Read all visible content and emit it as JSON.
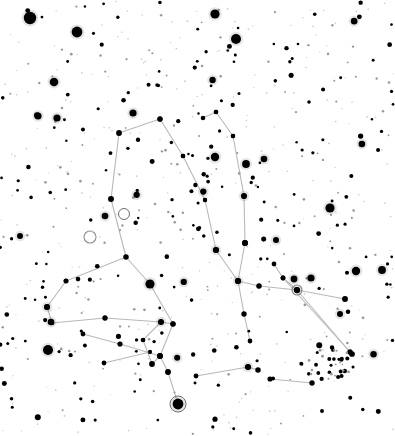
{
  "chart_data": {
    "type": "scatter",
    "title": "",
    "subtitle": "",
    "xlabel": "",
    "ylabel": "",
    "grid": false,
    "legend": "none",
    "xlim": [
      0,
      395
    ],
    "ylim": [
      0,
      436
    ],
    "background_color": "#ffffff",
    "star_color": "#000000",
    "faint_star_color": "#9a9a9a",
    "line_color": "#b8b8b8",
    "marker_color": "#8f8f8f",
    "magnitude_scale_note": "dot radius in px encodes brightness; larger = brighter",
    "counts": {
      "stars_plotted": 612,
      "constellation_line_segments": 26,
      "deep_sky_markers": 2,
      "ringed_stars": 2,
      "clusters": 1
    },
    "bright_stars": [
      {
        "x": 30,
        "y": 18,
        "r": 6.2
      },
      {
        "x": 77,
        "y": 32,
        "r": 5.4
      },
      {
        "x": 215,
        "y": 14,
        "r": 4.6
      },
      {
        "x": 236,
        "y": 39,
        "r": 5.0
      },
      {
        "x": 54,
        "y": 82,
        "r": 4.3
      },
      {
        "x": 38,
        "y": 116,
        "r": 3.6
      },
      {
        "x": 57,
        "y": 118,
        "r": 3.6
      },
      {
        "x": 133,
        "y": 113,
        "r": 3.6
      },
      {
        "x": 215,
        "y": 157,
        "r": 4.2
      },
      {
        "x": 246,
        "y": 164,
        "r": 3.9
      },
      {
        "x": 264,
        "y": 159,
        "r": 3.3
      },
      {
        "x": 330,
        "y": 208,
        "r": 4.6
      },
      {
        "x": 356,
        "y": 271,
        "r": 4.2
      },
      {
        "x": 382,
        "y": 270,
        "r": 3.9
      },
      {
        "x": 48,
        "y": 350,
        "r": 5.0
      },
      {
        "x": 51,
        "y": 322,
        "r": 3.3
      },
      {
        "x": 178,
        "y": 404,
        "r": 5.4
      },
      {
        "x": 20,
        "y": 236,
        "r": 3.0
      },
      {
        "x": 150,
        "y": 284,
        "r": 4.6
      },
      {
        "x": 105,
        "y": 216,
        "r": 3.3
      },
      {
        "x": 294,
        "y": 279,
        "r": 3.4
      },
      {
        "x": 311,
        "y": 278,
        "r": 3.6
      },
      {
        "x": 276,
        "y": 240,
        "r": 3.0
      },
      {
        "x": 340,
        "y": 314,
        "r": 3.0
      }
    ],
    "deep_sky_markers": [
      {
        "x": 90,
        "y": 237,
        "r": 6.0,
        "shape": "open-circle"
      },
      {
        "x": 297,
        "y": 290,
        "r": 5.0,
        "shape": "open-circle"
      }
    ],
    "ringed_stars": [
      {
        "x": 178,
        "y": 404,
        "r": 8.0
      },
      {
        "x": 124,
        "y": 214,
        "r": 5.5
      }
    ],
    "cluster": {
      "name": "open-cluster",
      "center_x": 326,
      "center_y": 363,
      "width": 52,
      "height": 34,
      "member_count": 34
    },
    "constellation_lines": [
      {
        "from": [
          119,
          133
        ],
        "to": [
          160,
          119
        ]
      },
      {
        "from": [
          160,
          119
        ],
        "to": [
          183,
          156
        ]
      },
      {
        "from": [
          183,
          156
        ],
        "to": [
          205,
          200
        ]
      },
      {
        "from": [
          119,
          133
        ],
        "to": [
          111,
          199
        ]
      },
      {
        "from": [
          111,
          199
        ],
        "to": [
          126,
          257
        ]
      },
      {
        "from": [
          126,
          257
        ],
        "to": [
          150,
          284
        ]
      },
      {
        "from": [
          150,
          284
        ],
        "to": [
          173,
          324
        ]
      },
      {
        "from": [
          205,
          200
        ],
        "to": [
          216,
          250
        ]
      },
      {
        "from": [
          216,
          250
        ],
        "to": [
          238,
          281
        ]
      },
      {
        "from": [
          203,
          118
        ],
        "to": [
          216,
          112
        ]
      },
      {
        "from": [
          216,
          112
        ],
        "to": [
          233,
          136
        ]
      },
      {
        "from": [
          233,
          136
        ],
        "to": [
          244,
          196
        ]
      },
      {
        "from": [
          244,
          196
        ],
        "to": [
          245,
          243
        ]
      },
      {
        "from": [
          245,
          243
        ],
        "to": [
          238,
          281
        ]
      },
      {
        "from": [
          238,
          281
        ],
        "to": [
          259,
          286
        ]
      },
      {
        "from": [
          259,
          286
        ],
        "to": [
          297,
          290
        ]
      },
      {
        "from": [
          297,
          290
        ],
        "to": [
          345,
          299
        ]
      },
      {
        "from": [
          126,
          257
        ],
        "to": [
          66,
          281
        ]
      },
      {
        "from": [
          66,
          281
        ],
        "to": [
          47,
          307
        ]
      },
      {
        "from": [
          47,
          307
        ],
        "to": [
          52,
          323
        ]
      },
      {
        "from": [
          52,
          323
        ],
        "to": [
          105,
          318
        ]
      },
      {
        "from": [
          105,
          318
        ],
        "to": [
          161,
          322
        ]
      },
      {
        "from": [
          161,
          322
        ],
        "to": [
          173,
          324
        ]
      },
      {
        "from": [
          173,
          324
        ],
        "to": [
          160,
          356
        ]
      },
      {
        "from": [
          160,
          356
        ],
        "to": [
          168,
          372
        ]
      },
      {
        "from": [
          168,
          372
        ],
        "to": [
          178,
          404
        ]
      },
      {
        "from": [
          161,
          322
        ],
        "to": [
          143,
          340
        ]
      },
      {
        "from": [
          143,
          340
        ],
        "to": [
          152,
          364
        ]
      },
      {
        "from": [
          152,
          364
        ],
        "to": [
          160,
          356
        ]
      },
      {
        "from": [
          297,
          290
        ],
        "to": [
          283,
          278
        ]
      },
      {
        "from": [
          283,
          278
        ],
        "to": [
          274,
          264
        ]
      },
      {
        "from": [
          297,
          290
        ],
        "to": [
          350,
          352
        ]
      },
      {
        "from": [
          283,
          278
        ],
        "to": [
          352,
          354
        ]
      },
      {
        "from": [
          238,
          281
        ],
        "to": [
          244,
          314
        ]
      },
      {
        "from": [
          244,
          314
        ],
        "to": [
          250,
          341
        ]
      },
      {
        "from": [
          83,
          334
        ],
        "to": [
          120,
          344
        ]
      },
      {
        "from": [
          120,
          344
        ],
        "to": [
          160,
          356
        ]
      },
      {
        "from": [
          104,
          363
        ],
        "to": [
          150,
          352
        ]
      },
      {
        "from": [
          196,
          376
        ],
        "to": [
          248,
          367
        ]
      },
      {
        "from": [
          248,
          367
        ],
        "to": [
          258,
          370
        ]
      },
      {
        "from": [
          270,
          379
        ],
        "to": [
          312,
          383
        ]
      }
    ]
  },
  "meta": {
    "canvas_width": 395,
    "canvas_height": 436
  }
}
